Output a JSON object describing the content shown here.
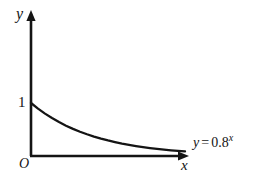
{
  "figure": {
    "background_color": "#ffffff",
    "ink_color": "#141414",
    "axes": {
      "y_axis_label": "y",
      "x_axis_label": "x",
      "origin_label": "O",
      "y_ticks": [
        "1"
      ],
      "x_ticks": []
    },
    "annotations": {
      "curve_equation": {
        "lhs": "y",
        "operator": "=",
        "base": "0.8",
        "exponent": "x",
        "full_text": "y = 0.8^x"
      }
    }
  },
  "chart_data": {
    "type": "line",
    "title": "",
    "subtitle": "",
    "xlabel": "x",
    "ylabel": "y",
    "legend": [
      "y = 0.8^x"
    ],
    "legend_position": "inline-right-of-curve",
    "grid": false,
    "xlim": [
      0,
      11
    ],
    "ylim": [
      0,
      1.35
    ],
    "y_tick_labels": [
      "1"
    ],
    "y_tick_values": [
      1
    ],
    "x_tick_labels": [],
    "x_tick_values": [],
    "origin_label": "O",
    "series": [
      {
        "name": "y = 0.8^x",
        "formula": "y = 0.8^x",
        "base": 0.8,
        "color": "#141414",
        "x": [
          0,
          0.5,
          1,
          1.5,
          2,
          2.5,
          3,
          3.5,
          4,
          4.5,
          5,
          5.5,
          6,
          6.5,
          7,
          7.5,
          8,
          8.5,
          9,
          9.5,
          10,
          10.5,
          11
        ],
        "y": [
          1.0,
          0.894,
          0.8,
          0.716,
          0.64,
          0.572,
          0.512,
          0.458,
          0.41,
          0.367,
          0.328,
          0.293,
          0.262,
          0.234,
          0.21,
          0.188,
          0.168,
          0.15,
          0.134,
          0.12,
          0.107,
          0.096,
          0.086
        ]
      }
    ]
  }
}
